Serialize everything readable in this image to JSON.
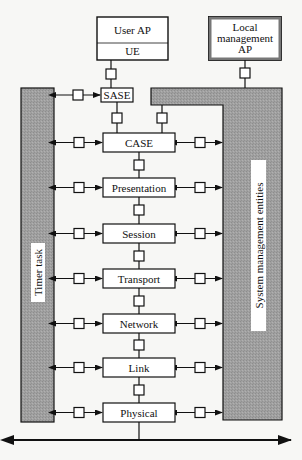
{
  "colors": {
    "background": "#f7f7f5",
    "gray_fill": "#9b9b9b",
    "stroke": "#111111",
    "box_fill": "#ffffff"
  },
  "top": {
    "user_ap": {
      "label": "User AP",
      "sub_label": "UE"
    },
    "local_mgmt_ap": {
      "lines": [
        "Local",
        "management",
        "AP"
      ]
    }
  },
  "sase": {
    "label": "SASE"
  },
  "layers": [
    {
      "label": "CASE"
    },
    {
      "label": "Presentation"
    },
    {
      "label": "Session"
    },
    {
      "label": "Transport"
    },
    {
      "label": "Network"
    },
    {
      "label": "Link"
    },
    {
      "label": "Physical"
    }
  ],
  "side_bars": {
    "left": {
      "label": "Timer task"
    },
    "right": {
      "label": "System management entities"
    }
  },
  "bus": {
    "description": "bidirectional physical medium arrow"
  }
}
